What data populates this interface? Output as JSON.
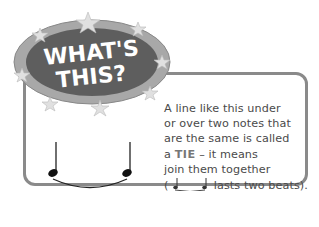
{
  "badge": {
    "line1": "WHAT'S",
    "line2": "THIS?"
  },
  "description": {
    "line1": "A line like this under",
    "line2": "or over two notes that",
    "line3": "are the same is called",
    "line4_prefix": "a ",
    "term": "TIE",
    "line4_suffix": " – it means",
    "line5": "join them together",
    "line6_open": "( ",
    "line6_close": " lasts two beats)."
  },
  "colors": {
    "border": "#8a8a8a",
    "badge_dark": "#5a5a5a",
    "badge_ring": "#9a9a9a",
    "text": "#4a4a4a"
  }
}
